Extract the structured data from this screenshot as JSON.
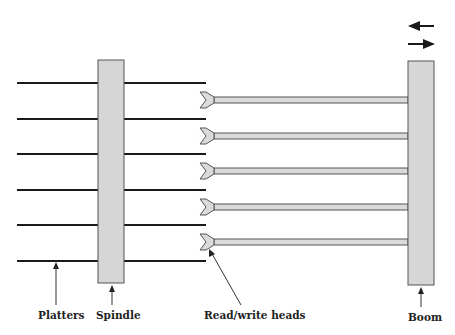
{
  "diagram": {
    "labels": {
      "platters": "Platters",
      "spindle": "Spindle",
      "heads": "Read/write heads",
      "boom": "Boom"
    },
    "platter_count": 6,
    "head_count": 5,
    "motion_arrows": [
      "arrow-left",
      "arrow-right"
    ],
    "colors": {
      "platter": "#1a1a1a",
      "component_fill": "#d6d6d6",
      "component_stroke": "#555555",
      "arm_fill": "#dadada",
      "text": "#222222"
    }
  }
}
